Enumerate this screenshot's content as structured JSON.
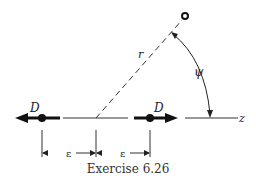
{
  "figure": {
    "caption": "Exercise 6.26",
    "labels": {
      "dipole_left": "D",
      "dipole_right": "D",
      "radius": "r",
      "angle": "ψ",
      "axis": "z",
      "spacing_left": "ε",
      "spacing_right": "ε"
    },
    "colors": {
      "ink": "#222222",
      "background": "#ffffff"
    }
  }
}
